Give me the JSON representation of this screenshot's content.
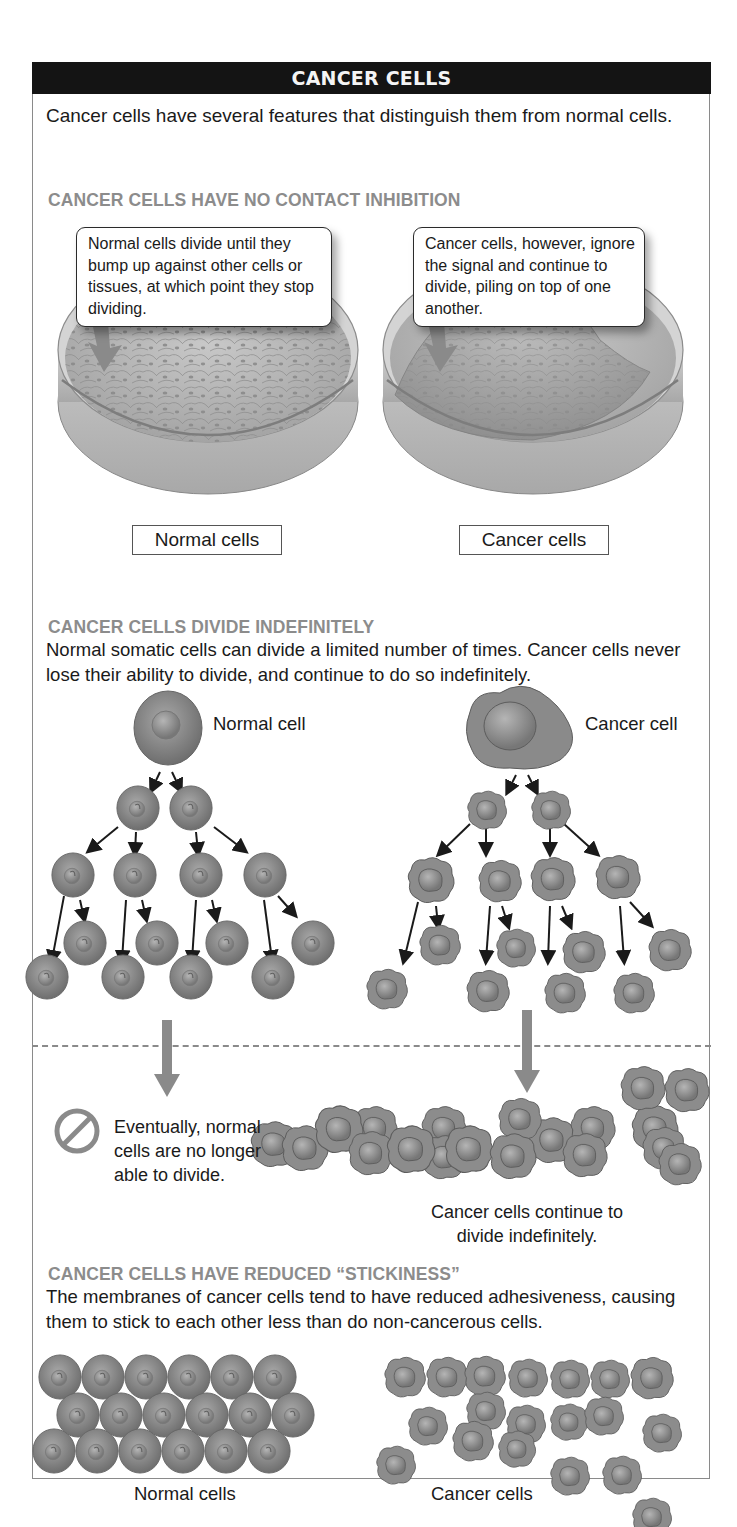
{
  "header": {
    "title": "CANCER CELLS"
  },
  "intro": "Cancer cells have several features that distinguish them from normal cells.",
  "sections": [
    {
      "title": "CANCER CELLS HAVE NO CONTACT INHIBITION",
      "callouts": {
        "normal": "Normal cells divide until they bump up against other cells or tissues, at which point they stop dividing.",
        "cancer": "Cancer cells, however, ignore the signal and continue to divide, piling on top of one another."
      },
      "labels": {
        "normal": "Normal cells",
        "cancer": "Cancer cells"
      }
    },
    {
      "title": "CANCER CELLS DIVIDE INDEFINITELY",
      "body": "Normal somatic cells can divide a limited number of times. Cancer cells never lose their ability to divide, and continue to do so indefinitely.",
      "labels": {
        "normal": "Normal cell",
        "cancer": "Cancer cell"
      },
      "outcomes": {
        "normal": "Eventually, normal cells are no longer able to divide.",
        "cancer": "Cancer cells continue to divide indefinitely."
      }
    },
    {
      "title": "CANCER CELLS HAVE REDUCED “STICKINESS”",
      "body": "The membranes of cancer cells tend to have reduced adhesiveness, causing them to stick to each other less than do non-cancerous cells.",
      "labels": {
        "normal": "Normal cells",
        "cancer": "Cancer cells"
      }
    }
  ],
  "icons": {
    "no_division": "prohibited-icon",
    "arrows": "down-arrow-icon"
  },
  "colors": {
    "header_bg": "#141414",
    "section_title": "#8c8c8c",
    "cell_fill": "#8a8a8a",
    "arrow": "#7a7a7a"
  }
}
